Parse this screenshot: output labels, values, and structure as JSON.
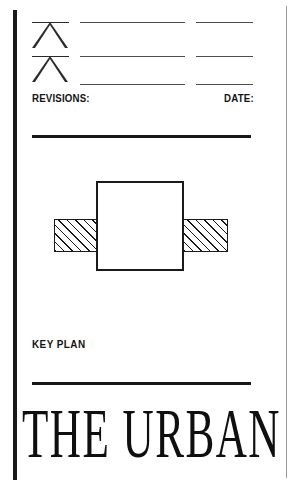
{
  "sheet": {
    "width": 299,
    "height": 488,
    "background": "#ffffff",
    "ink_color": "#1a1a1a"
  },
  "revisions_block": {
    "triangle_markers": [
      {
        "name": "revision-triangle-1"
      },
      {
        "name": "revision-triangle-2"
      }
    ],
    "rows": [
      {
        "description": "",
        "date": ""
      },
      {
        "description": "",
        "date": ""
      },
      {
        "description": "",
        "date": ""
      }
    ],
    "labels": {
      "revisions": "REVISIONS:",
      "date": "DATE:"
    }
  },
  "key_plan": {
    "label": "KEY PLAN",
    "shapes": {
      "center": {
        "name": "key-plan-center-block",
        "fill": "#ffffff",
        "stroke": "#1a1a1a"
      },
      "left_wing": {
        "name": "key-plan-left-wing",
        "fill": "hatched",
        "stroke": "#1a1a1a"
      },
      "right_wing": {
        "name": "key-plan-right-wing",
        "fill": "hatched",
        "stroke": "#1a1a1a"
      }
    }
  },
  "title": {
    "text": "THE URBAN"
  }
}
